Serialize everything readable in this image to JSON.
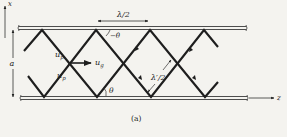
{
  "diagram": {
    "caption": "(a)",
    "colors": {
      "background": "#f4f3ef",
      "ink": "#1e1e1e",
      "plate": "#3a3a3a"
    },
    "axes": {
      "x_label": "x",
      "z_label": "z"
    },
    "labels": {
      "plate_separation": "a",
      "half_wavelength": "λ/2",
      "guide_half_wavelength": "λ′/2",
      "angle_bottom": "θ",
      "angle_top": "−θ",
      "phase_velocity_upper": "u",
      "phase_velocity_upper_sub": "p",
      "phase_velocity_lower": "u",
      "phase_velocity_lower_sub": "p",
      "group_velocity": "u",
      "group_velocity_sub": "g"
    },
    "plates": [
      {
        "name": "top-plate",
        "x1": 18,
        "x2": 246,
        "y": 28
      },
      {
        "name": "bottom-plate",
        "x1": 20,
        "x2": 247,
        "y": 98
      }
    ],
    "zigzag": {
      "top_vertices_x": [
        42,
        96,
        150,
        204
      ],
      "bottom_vertices_x": [
        44,
        97,
        151,
        205
      ],
      "crossings_x": [
        70,
        124,
        177
      ]
    }
  }
}
